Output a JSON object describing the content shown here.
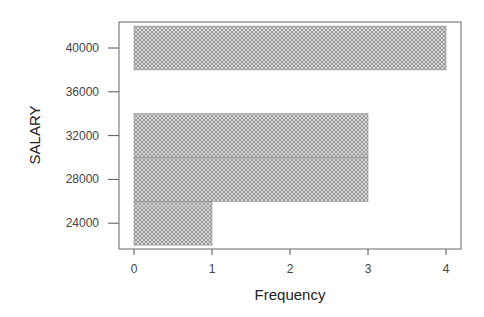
{
  "chart_data": {
    "type": "bar",
    "orientation": "horizontal",
    "title": "",
    "xlabel": "Frequency",
    "ylabel": "SALARY",
    "xlim": [
      0,
      4
    ],
    "ylim": [
      22000,
      42000
    ],
    "x_ticks": [
      "0",
      "1",
      "2",
      "3",
      "4"
    ],
    "y_ticks": [
      "24000",
      "28000",
      "32000",
      "36000",
      "40000"
    ],
    "bins": [
      {
        "from": 22000,
        "to": 26000,
        "center": 24000,
        "frequency": 1
      },
      {
        "from": 26000,
        "to": 30000,
        "center": 28000,
        "frequency": 3
      },
      {
        "from": 30000,
        "to": 34000,
        "center": 32000,
        "frequency": 3
      },
      {
        "from": 34000,
        "to": 38000,
        "center": 36000,
        "frequency": 0
      },
      {
        "from": 38000,
        "to": 42000,
        "center": 40000,
        "frequency": 4
      }
    ],
    "categories": [
      "24000",
      "28000",
      "32000",
      "36000",
      "40000"
    ],
    "values": [
      1,
      3,
      3,
      0,
      4
    ],
    "grid": false,
    "legend": null,
    "bar_fill": "crosshatch gray",
    "colors": {
      "bar_fill": "#c8c8c8",
      "hatch": "#8a8a8a",
      "axis": "#666666"
    }
  }
}
